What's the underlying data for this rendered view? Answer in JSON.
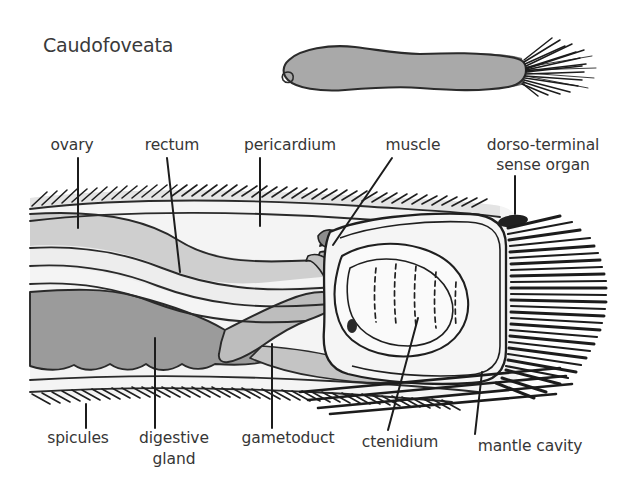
{
  "figure": {
    "title": "Caudofoveata"
  },
  "habitus": {
    "name": "whole-animal-drawing",
    "body_color": "#a9a9a9",
    "posterior_color": "#6f6f6f",
    "outline_color": "#2b2b2b"
  },
  "palette": {
    "ink": "#1c1c1c",
    "text": "#363636",
    "body_fill": "#f2f2f2",
    "cuticle_fill": "#e2e2e2",
    "ovary_fill": "#cfcfcf",
    "digestive_gland_fill": "#9b9b9b",
    "gametoduct_fill": "#bdbdbd",
    "muscle_fill": "#b4b4b4",
    "ctenidium_fill": "#f7f7f7",
    "mantle_cavity_fill": "#f4f4f4",
    "background": "#ffffff"
  },
  "labels": {
    "top": [
      {
        "id": "ovary",
        "text": "ovary",
        "x": 72,
        "y": 150,
        "anchor": "middle",
        "line": [
          [
            78,
            158
          ],
          [
            78,
            228
          ]
        ]
      },
      {
        "id": "rectum",
        "text": "rectum",
        "x": 172,
        "y": 150,
        "anchor": "middle",
        "line": [
          [
            167,
            158
          ],
          [
            180,
            272
          ]
        ]
      },
      {
        "id": "pericardium",
        "text": "pericardium",
        "x": 290,
        "y": 150,
        "anchor": "middle",
        "line": [
          [
            260,
            158
          ],
          [
            260,
            226
          ]
        ]
      },
      {
        "id": "muscle",
        "text": "muscle",
        "x": 413,
        "y": 150,
        "anchor": "middle",
        "line": [
          [
            392,
            158
          ],
          [
            333,
            245
          ]
        ]
      }
    ],
    "top_multiline": [
      {
        "id": "dorso-terminal-sense-organ",
        "lines": [
          "dorso-terminal",
          "sense organ"
        ],
        "x": 543,
        "y": 150,
        "line_height": 20,
        "anchor": "middle",
        "line": [
          [
            515,
            176
          ],
          [
            515,
            210
          ]
        ]
      }
    ],
    "bottom": [
      {
        "id": "spicules",
        "text": "spicules",
        "x": 78,
        "y": 443,
        "anchor": "middle",
        "line": [
          [
            86,
            404
          ],
          [
            86,
            428
          ]
        ]
      },
      {
        "id": "ctenidium",
        "text": "ctenidium",
        "x": 400,
        "y": 447,
        "anchor": "middle",
        "line": [
          [
            418,
            318
          ],
          [
            388,
            430
          ]
        ]
      },
      {
        "id": "mantle-cavity",
        "text": "mantle cavity",
        "x": 530,
        "y": 451,
        "anchor": "middle",
        "line": [
          [
            482,
            372
          ],
          [
            475,
            434
          ]
        ]
      }
    ],
    "bottom_multiline": [
      {
        "id": "digestive-gland",
        "lines": [
          "digestive",
          "gland"
        ],
        "x": 174,
        "y": 443,
        "line_height": 21,
        "anchor": "middle",
        "line": [
          [
            155,
            338
          ],
          [
            155,
            428
          ]
        ]
      },
      {
        "id": "gametoduct",
        "lines": [
          "gametoduct"
        ],
        "x": 288,
        "y": 443,
        "line_height": 21,
        "anchor": "middle",
        "line": [
          [
            272,
            344
          ],
          [
            272,
            428
          ]
        ]
      }
    ]
  },
  "structures": [
    {
      "id": "dorsal-spicule-band",
      "label": "dorsal spicule band"
    },
    {
      "id": "ventral-spicule-band",
      "label": "ventral spicule band"
    },
    {
      "id": "ovary-region",
      "label": "ovary"
    },
    {
      "id": "rectum-tube",
      "label": "rectum"
    },
    {
      "id": "pericardium-space",
      "label": "pericardium"
    },
    {
      "id": "digestive-gland-mass",
      "label": "digestive gland"
    },
    {
      "id": "gametoduct-tube",
      "label": "gametoduct"
    },
    {
      "id": "muscle-bands",
      "label": "muscle"
    },
    {
      "id": "ctenidium-gill",
      "label": "ctenidium"
    },
    {
      "id": "mantle-cavity-space",
      "label": "mantle cavity"
    },
    {
      "id": "sense-organ-spot",
      "label": "dorso-terminal sense organ"
    },
    {
      "id": "terminal-spine-fringe",
      "label": "terminal spines"
    }
  ]
}
